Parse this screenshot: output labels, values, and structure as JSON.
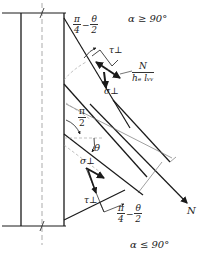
{
  "diagram": {
    "conditions": {
      "top": "α ≥ 90°",
      "bottom": "α ≤ 90°"
    },
    "labels": {
      "tau_perp_top": "τ⊥",
      "sigma_perp_top": "σ⊥",
      "tau_perp_bottom": "τ⊥",
      "sigma_perp_bottom": "σ⊥",
      "theta": "θ",
      "force": "N"
    },
    "fractions": {
      "stress_numerator": "N",
      "stress_denominator": "hₑ lᵥᵥ",
      "pi_half_num": "π",
      "pi_half_den": "2",
      "angle_top": {
        "a_num": "π",
        "a_den": "4",
        "op": "−",
        "b_num": "θ",
        "b_den": "2"
      },
      "angle_bottom": {
        "a_num": "π",
        "a_den": "4",
        "op": "−",
        "b_num": "θ",
        "b_den": "2"
      }
    },
    "colors": {
      "line": "#1a1a1a",
      "thin_line": "#777777",
      "background": "#ffffff"
    }
  }
}
